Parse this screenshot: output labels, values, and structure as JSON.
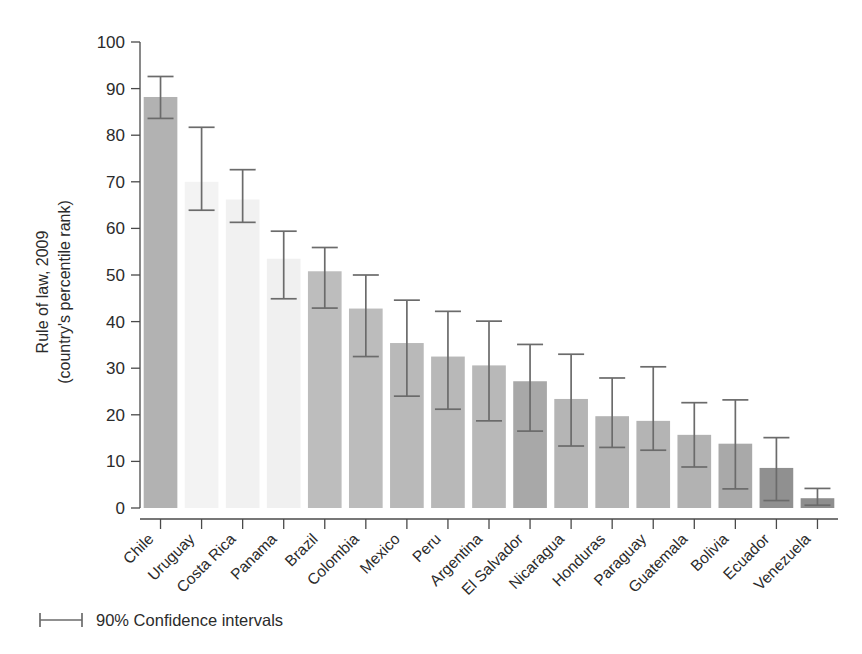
{
  "chart_data": {
    "type": "bar",
    "title": "",
    "xlabel": "",
    "ylabel": "Rule of law, 2009 (country's percentile rank)",
    "ylabel_line1": "Rule of law, 2009",
    "ylabel_line2": "(country's percentile rank)",
    "ylim": [
      0,
      100
    ],
    "yticks": [
      0,
      10,
      20,
      30,
      40,
      50,
      60,
      70,
      80,
      90,
      100
    ],
    "ytick_labels": [
      "0",
      "10",
      "20",
      "30",
      "40",
      "50",
      "60",
      "70",
      "80",
      "90",
      "100"
    ],
    "grid": false,
    "legend_position": "bottom-left",
    "legend_label": "90% Confidence intervals",
    "error_bar_note": "90% Confidence intervals",
    "categories": [
      "Chile",
      "Uruguay",
      "Costa Rica",
      "Panama",
      "Brazil",
      "Colombia",
      "Mexico",
      "Peru",
      "Argentina",
      "El Salvador",
      "Nicaragua",
      "Honduras",
      "Paraguay",
      "Guatemala",
      "Bolivia",
      "Ecuador",
      "Venezuela"
    ],
    "values": [
      88.2,
      70.0,
      66.2,
      53.5,
      50.8,
      42.8,
      35.4,
      32.5,
      30.6,
      27.2,
      23.4,
      19.7,
      18.7,
      15.7,
      13.8,
      8.6,
      2.1
    ],
    "ci_low": [
      83.6,
      63.9,
      61.3,
      44.9,
      42.9,
      32.5,
      24.0,
      21.2,
      18.7,
      16.5,
      13.3,
      13.0,
      12.4,
      8.8,
      4.1,
      1.6,
      0.6
    ],
    "ci_high": [
      92.6,
      81.7,
      72.6,
      59.4,
      55.9,
      50.0,
      44.6,
      42.2,
      40.1,
      35.1,
      33.0,
      27.9,
      30.3,
      22.6,
      23.2,
      15.1,
      4.2
    ],
    "bar_colors": [
      "#b2b2b2",
      "#f3f3f3",
      "#f1f1f1",
      "#f0f0f0",
      "#bdbdbd",
      "#bcbcbc",
      "#b9b9b9",
      "#b8b8b8",
      "#b8b8b8",
      "#a8a8a8",
      "#b5b5b5",
      "#b4b4b4",
      "#b4b4b4",
      "#b2b2b2",
      "#a9a9a9",
      "#909090",
      "#8e8e8e"
    ]
  }
}
